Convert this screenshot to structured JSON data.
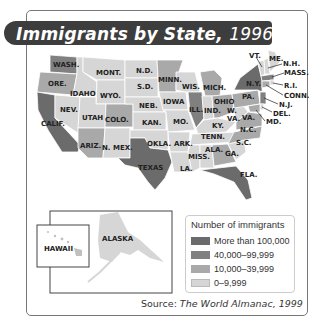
{
  "title": {
    "main": "Immigrants by State,",
    "year": "1996"
  },
  "legend": {
    "title": "Number of immigrants",
    "items": [
      {
        "label": "More than 100,000",
        "color": "#6b6b6b"
      },
      {
        "label": "40,000–99,999",
        "color": "#808080"
      },
      {
        "label": "10,000–39,999",
        "color": "#a9a9a9"
      },
      {
        "label": "0–9,999",
        "color": "#d6d6d6"
      }
    ]
  },
  "source": {
    "prefix": "Source: ",
    "name": "The World Almanac, 1999"
  },
  "insets": {
    "hawaii": "HAWAII",
    "alaska": "ALASKA"
  },
  "states": {
    "WA": "WASH.",
    "OR": "ORE.",
    "CA": "CALIF.",
    "ID": "IDAHO",
    "NV": "NEV.",
    "MT": "MONT.",
    "WY": "WYO.",
    "UT": "UTAH",
    "AZ": "ARIZ.",
    "CO": "COLO.",
    "NM": "N. MEX.",
    "ND": "N.D.",
    "SD": "S.D.",
    "NE": "NEB.",
    "KS": "KAN.",
    "OK": "OKLA.",
    "TX": "TEXAS",
    "MN": "MINN.",
    "IA": "IOWA",
    "MO": "MO.",
    "AR": "ARK.",
    "LA": "LA.",
    "WI": "WIS.",
    "IL": "ILL.",
    "MI": "MICH.",
    "IN": "IND.",
    "OH": "OHIO",
    "KY": "KY.",
    "TN": "TENN.",
    "MS": "MISS.",
    "AL": "ALA.",
    "GA": "GA.",
    "FL": "FLA.",
    "SC": "S.C.",
    "NC": "N.C.",
    "VA": "VA.",
    "WV": "W. VA.",
    "PA": "PA.",
    "NY": "N.Y.",
    "VT": "VT.",
    "ME": "ME.",
    "NH": "N.H.",
    "MA": "MASS.",
    "RI": "R.I.",
    "CT": "CONN.",
    "NJ": "N.J.",
    "DE": "DEL.",
    "MD": "MD."
  },
  "category_by_state": {
    "more_than_100000": [
      "CA",
      "TX",
      "NY",
      "FL"
    ],
    "40000_99999": [
      "IL",
      "NJ",
      "WA",
      "MA"
    ],
    "10000_39999": [
      "PA",
      "MI",
      "GA",
      "VA",
      "MD",
      "OH",
      "AZ",
      "OR",
      "CT",
      "CO",
      "MN",
      "NC"
    ],
    "0_9999": [
      "ID",
      "NV",
      "MT",
      "WY",
      "UT",
      "NM",
      "ND",
      "SD",
      "NE",
      "KS",
      "OK",
      "IA",
      "MO",
      "AR",
      "LA",
      "WI",
      "IN",
      "KY",
      "TN",
      "MS",
      "AL",
      "SC",
      "WV",
      "VT",
      "ME",
      "NH",
      "RI",
      "DE",
      "HI",
      "AK"
    ]
  }
}
